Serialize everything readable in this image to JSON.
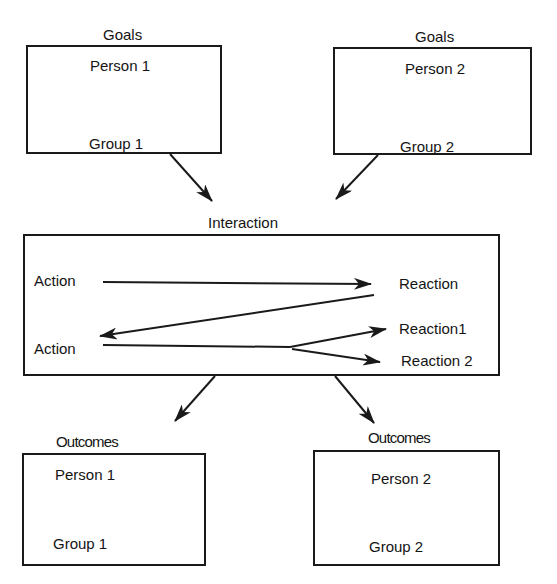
{
  "goals": {
    "left": {
      "heading": "Goals",
      "person": "Person 1",
      "group": "Group 1"
    },
    "right": {
      "heading": "Goals",
      "person": "Person 2",
      "group": "Group 2"
    }
  },
  "interaction": {
    "heading": "Interaction",
    "action_1": "Action",
    "reaction": "Reaction",
    "action_2": "Action",
    "reaction_1": "Reaction1",
    "reaction_2": "Reaction 2"
  },
  "outcomes": {
    "left": {
      "heading": "Outcomes",
      "person": "Person 1",
      "group": "Group 1"
    },
    "right": {
      "heading": "Outcomes",
      "person": "Person 2",
      "group": "Group 2"
    }
  },
  "colors": {
    "line": "#1a1a1a",
    "background": "#ffffff"
  }
}
